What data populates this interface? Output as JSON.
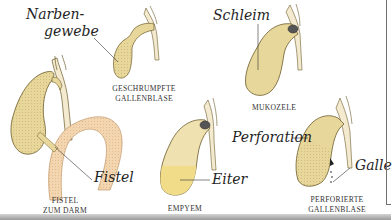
{
  "diagram": {
    "colors": {
      "gallbladder_fill": "#e8d79a",
      "gallbladder_stroke": "#6b5a2a",
      "duct_fill": "#f3ead0",
      "intestine_fill": "#f3d6b0",
      "pus_fill": "#f1dc8a",
      "stone_fill": "#555555",
      "label_color": "#1f1f1f",
      "background": "#ffffff"
    },
    "panels": [
      {
        "id": "fistel",
        "caption_line1": "FISTEL",
        "caption_line2": "ZUM DARM",
        "labels": [
          "Fistel"
        ]
      },
      {
        "id": "geschrumpfte",
        "caption_line1": "GESCHRUMPFTE",
        "caption_line2": "GALLENBLASE",
        "labels": [
          "Narben-",
          "gewebe"
        ]
      },
      {
        "id": "empyem",
        "caption_line1": "EMPYEM",
        "caption_line2": "",
        "labels": [
          "Eiter"
        ]
      },
      {
        "id": "mukozele",
        "caption_line1": "MUKOZELE",
        "caption_line2": "",
        "labels": [
          "Schleim"
        ]
      },
      {
        "id": "perforierte",
        "caption_line1": "PERFORIERTE",
        "caption_line2": "GALLENBLASE",
        "labels": [
          "Perforation",
          "Galle"
        ]
      }
    ]
  }
}
